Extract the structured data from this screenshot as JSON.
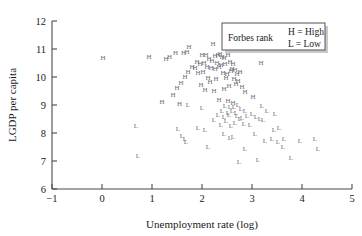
{
  "chart_data": {
    "type": "scatter",
    "title": "",
    "xlabel": "Unemployment rate (log)",
    "ylabel": "LGDP per capita",
    "xlim": [
      -1,
      5
    ],
    "ylim": [
      6,
      12
    ],
    "xticks": [
      -1,
      0,
      1,
      2,
      3,
      4,
      5
    ],
    "xticklabels": [
      "−1",
      "0",
      "1",
      "2",
      "3",
      "4",
      "5"
    ],
    "yticks": [
      6,
      7,
      8,
      9,
      10,
      11,
      12
    ],
    "yticklabels": [
      "6",
      "7",
      "8",
      "9",
      "10",
      "11",
      "12"
    ],
    "grid": false,
    "marker_style": "text-glyph",
    "legend": {
      "position": "top-right",
      "title": "Forbes rank",
      "entries": [
        {
          "symbol": "H",
          "label": "H = High"
        },
        {
          "symbol": "L",
          "label": "L = Low"
        }
      ]
    },
    "series": [
      {
        "name": "High Forbes rank",
        "symbol": "H",
        "color": "#6e6e78",
        "points": [
          [
            0.94,
            10.64
          ],
          [
            1.47,
            10.78
          ],
          [
            1.63,
            10.8
          ],
          [
            1.7,
            10.81
          ],
          [
            1.74,
            11.0
          ],
          [
            2.22,
            11.12
          ],
          [
            2.0,
            10.72
          ],
          [
            2.08,
            10.7
          ],
          [
            2.26,
            10.68
          ],
          [
            2.32,
            10.7
          ],
          [
            2.36,
            10.74
          ],
          [
            2.4,
            10.66
          ],
          [
            2.44,
            10.62
          ],
          [
            2.52,
            10.7
          ],
          [
            2.14,
            10.56
          ],
          [
            2.2,
            10.5
          ],
          [
            1.9,
            10.46
          ],
          [
            1.96,
            10.4
          ],
          [
            2.04,
            10.44
          ],
          [
            2.3,
            10.42
          ],
          [
            2.38,
            10.36
          ],
          [
            2.46,
            10.38
          ],
          [
            2.56,
            10.46
          ],
          [
            2.62,
            10.4
          ],
          [
            1.8,
            10.3
          ],
          [
            1.86,
            10.26
          ],
          [
            2.1,
            10.28
          ],
          [
            2.18,
            10.24
          ],
          [
            2.26,
            10.2
          ],
          [
            2.34,
            10.3
          ],
          [
            2.6,
            10.22
          ],
          [
            2.66,
            10.18
          ],
          [
            1.72,
            10.1
          ],
          [
            1.92,
            10.06
          ],
          [
            2.02,
            10.12
          ],
          [
            2.42,
            10.08
          ],
          [
            2.5,
            10.02
          ],
          [
            2.58,
            10.14
          ],
          [
            2.7,
            10.04
          ],
          [
            2.76,
            10.1
          ],
          [
            1.66,
            9.92
          ],
          [
            2.12,
            9.88
          ],
          [
            2.28,
            9.84
          ],
          [
            2.48,
            9.9
          ],
          [
            2.64,
            9.86
          ],
          [
            2.72,
            9.8
          ],
          [
            1.58,
            9.7
          ],
          [
            1.98,
            9.66
          ],
          [
            2.16,
            9.74
          ],
          [
            2.54,
            9.62
          ],
          [
            2.68,
            9.68
          ],
          [
            2.8,
            9.58
          ],
          [
            3.18,
            10.42
          ],
          [
            1.5,
            9.52
          ],
          [
            2.06,
            9.48
          ],
          [
            2.24,
            9.44
          ],
          [
            2.44,
            9.5
          ],
          [
            1.42,
            9.28
          ],
          [
            2.86,
            9.38
          ],
          [
            3.02,
            9.22
          ],
          [
            2.34,
            9.12
          ],
          [
            2.52,
            9.06
          ],
          [
            1.55,
            8.98
          ],
          [
            0.02,
            10.6
          ],
          [
            1.35,
            10.66
          ],
          [
            1.28,
            10.58
          ],
          [
            1.2,
            9.02
          ],
          [
            2.62,
            9.0
          ]
        ]
      },
      {
        "name": "Low Forbes rank",
        "symbol": "L",
        "color": "#6e6e78",
        "points": [
          [
            1.72,
            8.92
          ],
          [
            2.0,
            8.82
          ],
          [
            2.46,
            8.9
          ],
          [
            2.56,
            8.86
          ],
          [
            2.64,
            8.84
          ],
          [
            2.72,
            8.92
          ],
          [
            2.78,
            8.78
          ],
          [
            2.4,
            8.72
          ],
          [
            2.52,
            8.66
          ],
          [
            2.6,
            8.7
          ],
          [
            2.68,
            8.64
          ],
          [
            2.86,
            8.7
          ],
          [
            2.32,
            8.56
          ],
          [
            2.44,
            8.5
          ],
          [
            2.54,
            8.58
          ],
          [
            2.7,
            8.52
          ],
          [
            2.8,
            8.46
          ],
          [
            2.9,
            8.54
          ],
          [
            3.0,
            8.62
          ],
          [
            2.24,
            8.4
          ],
          [
            2.48,
            8.36
          ],
          [
            2.66,
            8.3
          ],
          [
            2.76,
            8.42
          ],
          [
            3.08,
            8.5
          ],
          [
            3.16,
            8.44
          ],
          [
            2.38,
            8.22
          ],
          [
            2.58,
            8.18
          ],
          [
            2.84,
            8.26
          ],
          [
            2.96,
            8.2
          ],
          [
            3.22,
            8.38
          ],
          [
            0.68,
            8.18
          ],
          [
            1.52,
            8.06
          ],
          [
            1.92,
            8.12
          ],
          [
            2.06,
            8.02
          ],
          [
            3.3,
            8.72
          ],
          [
            3.46,
            8.6
          ],
          [
            1.6,
            7.82
          ],
          [
            1.66,
            7.72
          ],
          [
            1.68,
            7.62
          ],
          [
            2.44,
            7.88
          ],
          [
            2.62,
            7.8
          ],
          [
            2.56,
            7.74
          ],
          [
            3.06,
            7.9
          ],
          [
            3.26,
            7.66
          ],
          [
            3.4,
            7.7
          ],
          [
            3.52,
            7.62
          ],
          [
            3.64,
            7.72
          ],
          [
            3.96,
            7.66
          ],
          [
            4.26,
            7.7
          ],
          [
            2.12,
            7.42
          ],
          [
            2.86,
            7.36
          ],
          [
            3.62,
            7.44
          ],
          [
            0.72,
            7.1
          ],
          [
            3.78,
            7.02
          ],
          [
            4.32,
            7.36
          ],
          [
            3.12,
            6.96
          ],
          [
            2.74,
            6.88
          ],
          [
            3.44,
            8.04
          ],
          [
            3.54,
            8.12
          ],
          [
            3.2,
            8.88
          ]
        ]
      }
    ]
  },
  "axes": {
    "x_title": "Unemployment rate (log)",
    "y_title": "LGDP per capita"
  }
}
